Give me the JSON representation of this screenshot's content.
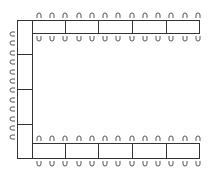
{
  "diagram": {
    "type": "U-shaped seating / table layout",
    "line_color": "#333333",
    "seat_color": "#555555",
    "left_table": {
      "x": 17,
      "y": 20,
      "w": 16,
      "h": 139,
      "dividers_y": [
        54,
        89,
        124
      ],
      "seats": 12,
      "seat_side": "left"
    },
    "top_table": {
      "x": 32,
      "y": 20,
      "w": 168,
      "h": 14,
      "dividers_x": [
        65,
        98,
        132,
        166
      ],
      "seats_top": 13,
      "seats_bottom": 13
    },
    "bottom_table": {
      "x": 32,
      "y": 143,
      "w": 168,
      "h": 16,
      "dividers_x": [
        65,
        98,
        132,
        166
      ],
      "seats_top": 13,
      "seats_bottom": 13
    }
  }
}
